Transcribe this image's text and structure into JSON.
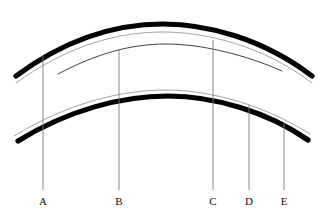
{
  "figure": {
    "canvas": {
      "width": 326,
      "height": 220,
      "background": "#ffffff"
    },
    "colors": {
      "arc_thick": "#000000",
      "arc_thin_light": "#9a9a9a",
      "arc_thin_dark": "#2b2b2b",
      "leader_line": "#7a7a7a",
      "label_text": "#111111"
    },
    "curves": [
      {
        "name": "upper-thick-arc",
        "style": "thick-black",
        "stroke": "#000000",
        "width": 5.2,
        "path": "M 16 76 C 70 36, 120 24, 163 24 C 206 24, 262 38, 312 76"
      },
      {
        "name": "upper-thin-light-arc",
        "style": "thin-light",
        "stroke": "#9a9a9a",
        "width": 0.9,
        "path": "M 16 83 C 70 44, 120 32, 163 32 C 206 32, 264 46, 312 83"
      },
      {
        "name": "inner-thin-dark-arc",
        "style": "thin-dark",
        "stroke": "#2b2b2b",
        "width": 0.9,
        "path": "M 58 74 C 96 54, 130 44, 166 44 C 202 44, 246 55, 282 71"
      },
      {
        "name": "lower-thin-light-arc",
        "style": "thin-light",
        "stroke": "#9a9a9a",
        "width": 0.9,
        "path": "M 14 136 C 66 104, 120 90, 166 90 C 212 90, 266 106, 310 134"
      },
      {
        "name": "lower-thick-arc",
        "style": "thick-black",
        "stroke": "#000000",
        "width": 5.2,
        "path": "M 18 141 C 68 110, 122 96, 168 96 C 214 96, 268 112, 308 140"
      }
    ],
    "leader_lines": [
      {
        "name": "leader-a",
        "label": "A",
        "x": 43,
        "y_top": 56,
        "y_bottom": 190,
        "label_y": 196
      },
      {
        "name": "leader-b",
        "label": "B",
        "x": 119,
        "y_top": 50,
        "y_bottom": 190,
        "label_y": 196
      },
      {
        "name": "leader-c",
        "label": "C",
        "x": 213,
        "y_top": 40,
        "y_bottom": 190,
        "label_y": 196
      },
      {
        "name": "leader-d",
        "label": "D",
        "x": 249,
        "y_top": 105,
        "y_bottom": 190,
        "label_y": 196
      },
      {
        "name": "leader-e",
        "label": "E",
        "x": 284,
        "y_top": 122,
        "y_bottom": 190,
        "label_y": 196
      }
    ],
    "labels": {
      "a": "A",
      "b": "B",
      "c": "C",
      "d": "D",
      "e": "E"
    }
  }
}
